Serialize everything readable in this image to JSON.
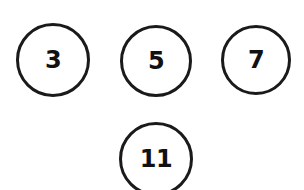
{
  "canvas": {
    "width": 304,
    "height": 190,
    "background": "#ffffff"
  },
  "style": {
    "stroke_color": "#1a1a1a",
    "text_color": "#111111",
    "fill_color": "#ffffff",
    "stroke_width": 3
  },
  "diagram": {
    "type": "node-set",
    "nodes": [
      {
        "id": "node-3",
        "label": "3",
        "cx": 53,
        "cy": 60,
        "r": 37,
        "font_size": 24,
        "clipped": false
      },
      {
        "id": "node-5",
        "label": "5",
        "cx": 156,
        "cy": 61,
        "r": 36,
        "font_size": 24,
        "clipped": false
      },
      {
        "id": "node-7",
        "label": "7",
        "cx": 256,
        "cy": 60,
        "r": 35,
        "font_size": 24,
        "clipped": false
      },
      {
        "id": "node-11",
        "label": "11",
        "cx": 156,
        "cy": 159,
        "r": 37,
        "font_size": 24,
        "clipped": true
      }
    ]
  }
}
